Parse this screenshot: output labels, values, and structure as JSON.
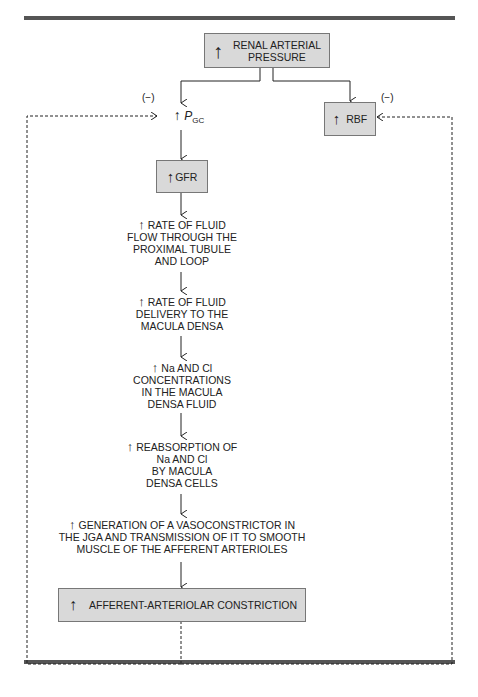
{
  "figure": {
    "up_arrow_symbol": "↑",
    "negative_label": "(−)",
    "nodes": {
      "renal_arterial_pressure": {
        "lines": [
          "RENAL ARTERIAL",
          "PRESSURE"
        ]
      },
      "p_gc": {
        "symbol": "P",
        "subscript": "GC"
      },
      "rbf": {
        "label": "RBF"
      },
      "gfr": {
        "label": "GFR"
      },
      "flow_proximal": {
        "lines": [
          "RATE OF FLUID",
          "FLOW THROUGH THE",
          "PROXIMAL TUBULE",
          "AND LOOP"
        ]
      },
      "delivery_macula": {
        "lines": [
          "RATE OF FLUID",
          "DELIVERY TO THE",
          "MACULA DENSA"
        ]
      },
      "na_cl_conc": {
        "lines": [
          "Na AND Cl",
          "CONCENTRATIONS",
          "IN THE MACULA",
          "DENSA FLUID"
        ]
      },
      "reabsorption": {
        "lines": [
          "REABSORPTION OF",
          "Na AND Cl",
          "BY MACULA",
          "DENSA CELLS"
        ]
      },
      "vasoconstrictor": {
        "lines": [
          "GENERATION OF A VASOCONSTRICTOR IN",
          "THE JGA AND TRANSMISSION OF IT TO SMOOTH",
          "MUSCLE OF THE AFFERENT ARTERIOLES"
        ]
      },
      "afferent_constriction": {
        "label": "AFFERENT-ARTERIOLAR CONSTRICTION"
      }
    }
  }
}
